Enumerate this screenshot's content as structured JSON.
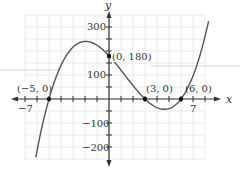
{
  "chart_data": {
    "type": "line",
    "title": "",
    "xlabel": "x",
    "ylabel": "y",
    "function": "2(x+5)(x-3)(x-6)",
    "xlim": [
      -7,
      8
    ],
    "ylim": [
      -200,
      300
    ],
    "grid": true,
    "x_tick_labels": [
      "-7",
      "7"
    ],
    "y_tick_labels": [
      "300",
      "100",
      "-100",
      "-200"
    ],
    "annotations": [
      {
        "label": "(-5, 0)",
        "x": -5,
        "y": 0
      },
      {
        "label": "(0, 180)",
        "x": 0,
        "y": 180
      },
      {
        "label": "(3, 0)",
        "x": 3,
        "y": 0
      },
      {
        "label": "(6, 0)",
        "x": 6,
        "y": 0
      }
    ],
    "points": [
      {
        "x": -6.1,
        "y": -242
      },
      {
        "x": -5,
        "y": 0
      },
      {
        "x": -4,
        "y": 98
      },
      {
        "x": -3,
        "y": 162
      },
      {
        "x": -2,
        "y": 200
      },
      {
        "x": -1.5,
        "y": 202
      },
      {
        "x": -1,
        "y": 196
      },
      {
        "x": 0,
        "y": 180
      },
      {
        "x": 1,
        "y": 120
      },
      {
        "x": 2,
        "y": 56
      },
      {
        "x": 3,
        "y": 0
      },
      {
        "x": 4,
        "y": -36
      },
      {
        "x": 4.6,
        "y": -43
      },
      {
        "x": 5,
        "y": -40
      },
      {
        "x": 6,
        "y": 0
      },
      {
        "x": 7,
        "y": 96
      },
      {
        "x": 8.3,
        "y": 340
      }
    ],
    "color": "#555555"
  },
  "labels": {
    "x_axis": "x",
    "y_axis": "y",
    "xt_neg7": "−7",
    "xt_7": "7",
    "yt_300": "300",
    "yt_100": "100",
    "yt_m100": "−100",
    "yt_m200": "−200",
    "pt_m5": "(−5, 0)",
    "pt_0": "(0, 180)",
    "pt_3": "(3, 0)",
    "pt_6": "(6, 0)"
  }
}
